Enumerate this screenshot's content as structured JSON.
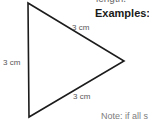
{
  "page": {
    "background_color": "#ffffff",
    "width": 149,
    "height": 120
  },
  "heading": {
    "examples_label": "Examples:"
  },
  "clipped_text": {
    "top": "length.",
    "bottom": "Note: if all s"
  },
  "figure": {
    "name": "equilateral-triangle",
    "stroke_color": "#1c1c1c",
    "fill_color": "#ffffff",
    "stroke_width": 1.6,
    "orientation": "points-right",
    "vertices": {
      "top": [
        28,
        3
      ],
      "bottom": [
        29,
        117
      ],
      "right": [
        124,
        61
      ]
    },
    "side_labels": {
      "left": "3 cm",
      "top_right": "3 cm",
      "bottom_right": "3 cm"
    },
    "label_color": "#555555"
  }
}
